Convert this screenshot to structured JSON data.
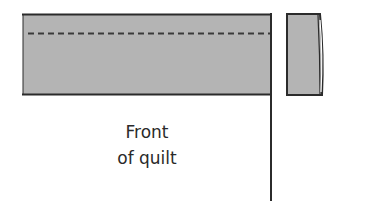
{
  "diagram": {
    "label_line1": "Front",
    "label_line2": "of quilt",
    "colors": {
      "fabric_fill": "#b4b4b4",
      "outline": "#2b2b2b",
      "background": "#ffffff"
    },
    "elements": [
      {
        "name": "binding-strip",
        "description": "gray strip with dashed stitch line along quilt top edge"
      },
      {
        "name": "stitch-line",
        "style": "dashed"
      },
      {
        "name": "quilt-edge-line",
        "description": "vertical line marking right edge of quilt"
      },
      {
        "name": "folded-binding-end",
        "description": "small gray piece with folded right edge"
      }
    ]
  }
}
